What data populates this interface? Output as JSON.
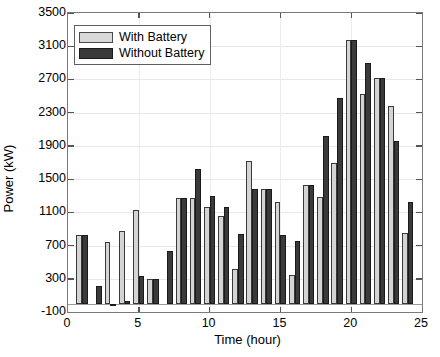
{
  "chart_data": {
    "type": "bar",
    "title": "",
    "xlabel": "Time (hour)",
    "ylabel": "Power (kW)",
    "xlim": [
      0,
      25
    ],
    "ylim": [
      -100,
      3500
    ],
    "xticks": [
      0,
      5,
      10,
      15,
      20,
      25
    ],
    "yticks": [
      -100,
      300,
      700,
      1100,
      1500,
      1900,
      2300,
      2700,
      3100,
      3500
    ],
    "grid": true,
    "legend_position": "top-left",
    "categories": [
      1,
      2,
      3,
      4,
      5,
      6,
      7,
      8,
      9,
      10,
      11,
      12,
      13,
      14,
      15,
      16,
      17,
      18,
      19,
      20,
      21,
      22,
      23,
      24
    ],
    "series": [
      {
        "name": "With Battery",
        "color": "#d4d4d4",
        "values": [
          830,
          0,
          740,
          870,
          1130,
          300,
          0,
          1270,
          1270,
          1160,
          1050,
          420,
          1720,
          1380,
          1230,
          340,
          1430,
          1290,
          1700,
          3180,
          2530,
          2720,
          2380,
          850
        ]
      },
      {
        "name": "Without Battery",
        "color": "#3a3a3a",
        "values": [
          830,
          210,
          -30,
          30,
          330,
          300,
          640,
          1270,
          1620,
          1300,
          1160,
          840,
          1380,
          1380,
          830,
          760,
          1430,
          2020,
          2480,
          3180,
          2900,
          2720,
          1960,
          1220
        ]
      }
    ]
  },
  "legend": {
    "items": [
      {
        "label": "With Battery"
      },
      {
        "label": "Without Battery"
      }
    ]
  },
  "axes": {
    "y_tick_labels": [
      "3500",
      "3100",
      "2700",
      "2300",
      "1900",
      "1500",
      "1100",
      "700",
      "300",
      "-100"
    ],
    "x_tick_labels": [
      "0",
      "5",
      "10",
      "15",
      "20",
      "25"
    ]
  }
}
